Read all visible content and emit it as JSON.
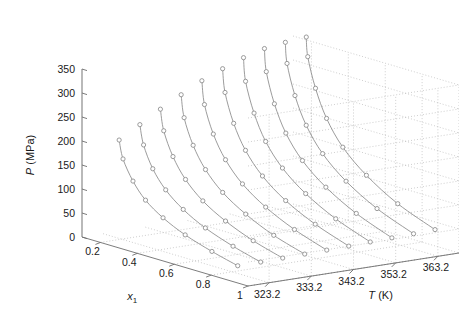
{
  "figure": {
    "type": "3d-line",
    "background": "#ffffff",
    "line_color": "#8a8a8a",
    "marker_color": "#8a8a8a",
    "grid_color": "#b9b9b9",
    "axis_color": "#6e6e6e",
    "text_color": "#1a1a1a"
  },
  "axes": {
    "p_axis": {
      "label": "P (MPa)",
      "label_italic": "P",
      "label_rest": " (MPa)",
      "ticks": [
        "0",
        "50",
        "100",
        "150",
        "200",
        "250",
        "300",
        "350"
      ],
      "values": [
        0,
        50,
        100,
        150,
        200,
        250,
        300,
        350
      ],
      "range": [
        0,
        350
      ]
    },
    "x_axis": {
      "label": "x",
      "label_sub": "1",
      "ticks": [
        "0.2",
        "0.4",
        "0.6",
        "0.8",
        "1"
      ],
      "values": [
        0.2,
        0.4,
        0.6,
        0.8,
        1.0
      ],
      "range": [
        0.1,
        1.0
      ]
    },
    "t_axis": {
      "label": "T (K)",
      "label_italic": "T",
      "label_rest": " (K)",
      "ticks": [
        "323.2",
        "333.2",
        "343.2",
        "353.2",
        "363.2"
      ],
      "values": [
        323.2,
        333.2,
        343.2,
        353.2,
        363.2
      ],
      "range": [
        318.2,
        368.2
      ]
    }
  },
  "chart_data": {
    "type": "line",
    "title": "",
    "xlabel": "x1",
    "ylabel": "T (K)",
    "zlabel": "P (MPa)",
    "xlim": [
      0.1,
      1.0
    ],
    "ylim": [
      318.2,
      368.2
    ],
    "zlim": [
      0,
      350
    ],
    "grid": true,
    "legend": "none",
    "marker": "circle-open",
    "note": "Isotherm P-x1 curves at ten temperatures; each series is one temperature (T held constant) traced across composition x1.",
    "series": [
      {
        "name": "323.2 K",
        "T": 323.2,
        "x1": [
          0.187,
          0.208,
          0.262,
          0.33,
          0.425,
          0.545,
          0.69,
          0.83
        ],
        "P": [
          205,
          168,
          128,
          96,
          70,
          48,
          30,
          16
        ]
      },
      {
        "name": "328.2 K",
        "T": 328.2,
        "x1": [
          0.185,
          0.205,
          0.255,
          0.325,
          0.42,
          0.54,
          0.69,
          0.84
        ],
        "P": [
          230,
          190,
          146,
          110,
          80,
          55,
          34,
          18
        ]
      },
      {
        "name": "333.2 K",
        "T": 333.2,
        "x1": [
          0.182,
          0.2,
          0.25,
          0.318,
          0.412,
          0.535,
          0.685,
          0.845
        ],
        "P": [
          255,
          212,
          164,
          124,
          90,
          62,
          38,
          20
        ]
      },
      {
        "name": "338.2 K",
        "T": 338.2,
        "x1": [
          0.18,
          0.196,
          0.245,
          0.312,
          0.405,
          0.53,
          0.682,
          0.85
        ],
        "P": [
          278,
          232,
          180,
          137,
          100,
          69,
          42,
          22
        ]
      },
      {
        "name": "343.2 K",
        "T": 343.2,
        "x1": [
          0.178,
          0.192,
          0.24,
          0.306,
          0.398,
          0.524,
          0.68,
          0.855
        ],
        "P": [
          300,
          252,
          196,
          150,
          110,
          76,
          47,
          24
        ]
      },
      {
        "name": "348.2 K",
        "T": 348.2,
        "x1": [
          0.176,
          0.189,
          0.236,
          0.3,
          0.392,
          0.518,
          0.678,
          0.86
        ],
        "P": [
          318,
          270,
          211,
          162,
          119,
          82,
          51,
          26
        ]
      },
      {
        "name": "353.2 K",
        "T": 353.2,
        "x1": [
          0.175,
          0.186,
          0.232,
          0.295,
          0.386,
          0.512,
          0.675,
          0.862
        ],
        "P": [
          334,
          286,
          225,
          173,
          128,
          89,
          55,
          28
        ]
      },
      {
        "name": "358.2 K",
        "T": 358.2,
        "x1": [
          0.174,
          0.184,
          0.228,
          0.29,
          0.38,
          0.507,
          0.672,
          0.865
        ],
        "P": [
          346,
          299,
          237,
          183,
          136,
          95,
          59,
          30
        ]
      },
      {
        "name": "363.2 K",
        "T": 363.2,
        "x1": [
          0.173,
          0.182,
          0.225,
          0.286,
          0.375,
          0.502,
          0.67,
          0.868
        ],
        "P": [
          352,
          309,
          247,
          192,
          143,
          100,
          62,
          32
        ]
      },
      {
        "name": "368.2 K",
        "T": 368.2,
        "x1": [
          0.172,
          0.18,
          0.222,
          0.282,
          0.37,
          0.498,
          0.668,
          0.87
        ],
        "P": [
          356,
          316,
          255,
          199,
          149,
          105,
          65,
          34
        ]
      }
    ]
  }
}
